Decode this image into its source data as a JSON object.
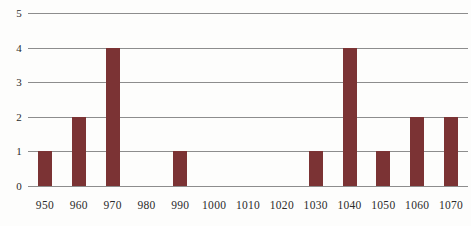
{
  "chart_data": {
    "type": "bar",
    "title": "",
    "subtitle": "",
    "xlabel": "",
    "ylabel": "",
    "categories": [
      "950",
      "960",
      "970",
      "980",
      "990",
      "1000",
      "1010",
      "1020",
      "1030",
      "1040",
      "1050",
      "1060",
      "1070"
    ],
    "values": [
      1,
      2,
      4,
      0,
      1,
      0,
      0,
      0,
      1,
      4,
      1,
      2,
      2
    ],
    "ylim": [
      0,
      5
    ],
    "ytick_labels": [
      "0",
      "1",
      "2",
      "3",
      "4",
      "5"
    ],
    "ytick_values": [
      0,
      1,
      2,
      3,
      4,
      5
    ],
    "grid": true,
    "legend": "none",
    "series": [
      {
        "name": "",
        "values": [
          1,
          2,
          4,
          0,
          1,
          0,
          0,
          0,
          1,
          4,
          1,
          2,
          2
        ]
      }
    ],
    "colors": {
      "bar": "#7b3334",
      "gridline": "#8d8d8d",
      "axis_text": "#2b2b2b",
      "background": "#fdfdfc"
    }
  }
}
